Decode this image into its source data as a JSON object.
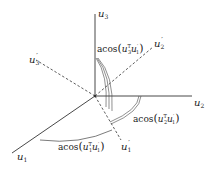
{
  "diagram": {
    "title": "",
    "origin": {
      "x": 95,
      "y": 96
    },
    "axes": [
      {
        "id": "u1",
        "name": "u",
        "sub": "1",
        "prime": "",
        "style": "solid",
        "x2": 12,
        "y2": 153,
        "lx": 17,
        "ly": 160
      },
      {
        "id": "u2",
        "name": "u",
        "sub": "2",
        "prime": "",
        "style": "solid",
        "x2": 192,
        "y2": 96,
        "lx": 194,
        "ly": 106
      },
      {
        "id": "u3",
        "name": "u",
        "sub": "3",
        "prime": "",
        "style": "solid",
        "x2": 95,
        "y2": 14,
        "lx": 98,
        "ly": 17
      },
      {
        "id": "u1p",
        "name": "u",
        "sub": "1",
        "prime": "′",
        "style": "dashed",
        "x2": 121,
        "y2": 140,
        "lx": 121,
        "ly": 150
      },
      {
        "id": "u2p",
        "name": "u",
        "sub": "2",
        "prime": "′",
        "style": "dashed",
        "x2": 153,
        "y2": 47,
        "lx": 154,
        "ly": 47
      },
      {
        "id": "u3p",
        "name": "u",
        "sub": "3",
        "prime": "′",
        "style": "dashed",
        "x2": 36,
        "y2": 60,
        "lx": 31,
        "ly": 63
      }
    ],
    "angle_labels": [
      {
        "id": "angle-u3-u1p",
        "func": "acos",
        "a": "u",
        "a_sub": "3",
        "a_sup": "T",
        "b": "u",
        "b_sub": "1",
        "b_prime": "′",
        "x": 97,
        "y": 51
      },
      {
        "id": "angle-u2-u1p",
        "func": "acos",
        "a": "u",
        "a_sub": "2",
        "a_sup": "T",
        "b": "u",
        "b_sub": "1",
        "b_prime": "′",
        "x": 133,
        "y": 122
      },
      {
        "id": "angle-u1-u1p",
        "func": "acos",
        "a": "u",
        "a_sub": "1",
        "a_sup": "T",
        "b": "u",
        "b_sub": "1",
        "b_prime": "′",
        "x": 58,
        "y": 150
      }
    ],
    "colors": {
      "line": "#333333",
      "text": "#222222",
      "background": "#ffffff"
    }
  }
}
